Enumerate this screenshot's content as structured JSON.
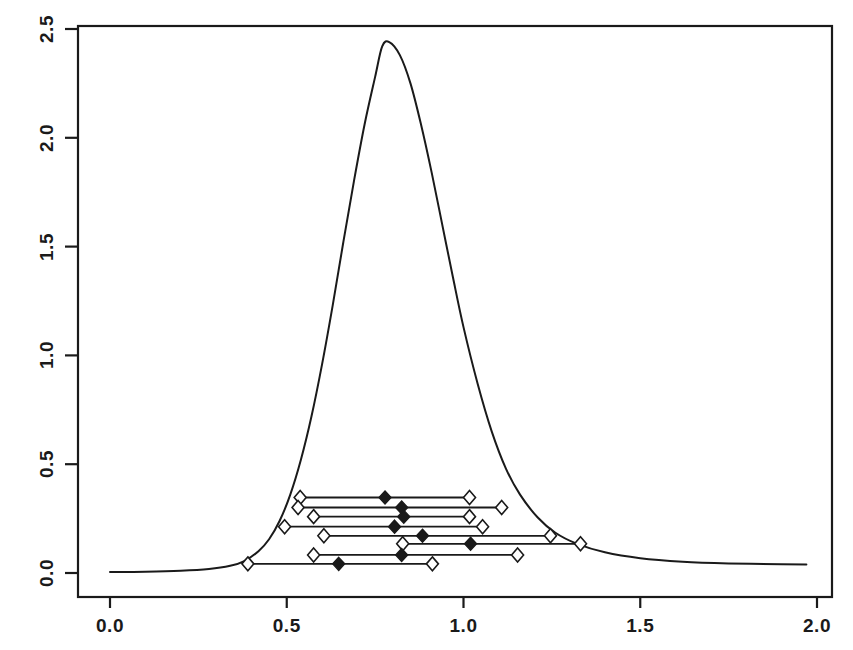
{
  "chart_data": {
    "type": "line",
    "title": "",
    "subtitle": "",
    "xlabel": "",
    "ylabel": "",
    "xlim": [
      0.0,
      2.0
    ],
    "ylim": [
      0.0,
      2.5
    ],
    "grid": false,
    "legend": "none",
    "box": true,
    "x_ticks": [
      {
        "value": 0.0,
        "label": "0.0"
      },
      {
        "value": 0.5,
        "label": "0.5"
      },
      {
        "value": 1.0,
        "label": "1.0"
      },
      {
        "value": 1.5,
        "label": "1.5"
      },
      {
        "value": 2.0,
        "label": "2.0"
      }
    ],
    "y_ticks": [
      {
        "value": 0.0,
        "label": "0.0"
      },
      {
        "value": 0.5,
        "label": "0.5"
      },
      {
        "value": 1.0,
        "label": "1.0"
      },
      {
        "value": 1.5,
        "label": "1.5"
      },
      {
        "value": 2.0,
        "label": "2.0"
      },
      {
        "value": 2.5,
        "label": "2.5"
      }
    ],
    "series": [
      {
        "name": "density-curve",
        "type": "line",
        "style": "solid",
        "color": "#1a1a1a",
        "peak": {
          "x": 0.77,
          "y": 2.44
        },
        "points": [
          {
            "x": 0.0,
            "y": 0.005
          },
          {
            "x": 0.1,
            "y": 0.006
          },
          {
            "x": 0.2,
            "y": 0.01
          },
          {
            "x": 0.28,
            "y": 0.018
          },
          {
            "x": 0.34,
            "y": 0.033
          },
          {
            "x": 0.38,
            "y": 0.055
          },
          {
            "x": 0.42,
            "y": 0.1
          },
          {
            "x": 0.45,
            "y": 0.155
          },
          {
            "x": 0.48,
            "y": 0.24
          },
          {
            "x": 0.51,
            "y": 0.36
          },
          {
            "x": 0.54,
            "y": 0.52
          },
          {
            "x": 0.57,
            "y": 0.72
          },
          {
            "x": 0.6,
            "y": 0.96
          },
          {
            "x": 0.63,
            "y": 1.23
          },
          {
            "x": 0.66,
            "y": 1.52
          },
          {
            "x": 0.69,
            "y": 1.8
          },
          {
            "x": 0.72,
            "y": 2.06
          },
          {
            "x": 0.75,
            "y": 2.28
          },
          {
            "x": 0.77,
            "y": 2.42
          },
          {
            "x": 0.79,
            "y": 2.44
          },
          {
            "x": 0.82,
            "y": 2.38
          },
          {
            "x": 0.85,
            "y": 2.25
          },
          {
            "x": 0.88,
            "y": 2.06
          },
          {
            "x": 0.91,
            "y": 1.84
          },
          {
            "x": 0.94,
            "y": 1.6
          },
          {
            "x": 0.97,
            "y": 1.36
          },
          {
            "x": 1.0,
            "y": 1.13
          },
          {
            "x": 1.04,
            "y": 0.87
          },
          {
            "x": 1.08,
            "y": 0.65
          },
          {
            "x": 1.12,
            "y": 0.48
          },
          {
            "x": 1.16,
            "y": 0.36
          },
          {
            "x": 1.21,
            "y": 0.255
          },
          {
            "x": 1.26,
            "y": 0.185
          },
          {
            "x": 1.32,
            "y": 0.135
          },
          {
            "x": 1.4,
            "y": 0.095
          },
          {
            "x": 1.5,
            "y": 0.068
          },
          {
            "x": 1.62,
            "y": 0.052
          },
          {
            "x": 1.75,
            "y": 0.044
          },
          {
            "x": 1.9,
            "y": 0.04
          },
          {
            "x": 1.97,
            "y": 0.039
          }
        ]
      }
    ],
    "intervals": {
      "description": "Horizontal confidence intervals with open diamond endpoints and a filled diamond point estimate",
      "marker_endpoint": "open-diamond",
      "marker_estimate": "filled-diamond",
      "rows": [
        {
          "y": 0.347,
          "lower": 0.538,
          "estimate": 0.778,
          "upper": 1.017
        },
        {
          "y": 0.301,
          "lower": 0.532,
          "estimate": 0.825,
          "upper": 1.108
        },
        {
          "y": 0.259,
          "lower": 0.576,
          "estimate": 0.831,
          "upper": 1.017
        },
        {
          "y": 0.213,
          "lower": 0.494,
          "estimate": 0.805,
          "upper": 1.054
        },
        {
          "y": 0.171,
          "lower": 0.605,
          "estimate": 0.884,
          "upper": 1.246
        },
        {
          "y": 0.134,
          "lower": 0.828,
          "estimate": 1.02,
          "upper": 1.331
        },
        {
          "y": 0.083,
          "lower": 0.576,
          "estimate": 0.825,
          "upper": 1.153
        },
        {
          "y": 0.042,
          "lower": 0.39,
          "estimate": 0.647,
          "upper": 0.912
        }
      ]
    }
  },
  "axes": {
    "y_axis_name": "y-axis",
    "x_axis_name": "x-axis"
  }
}
